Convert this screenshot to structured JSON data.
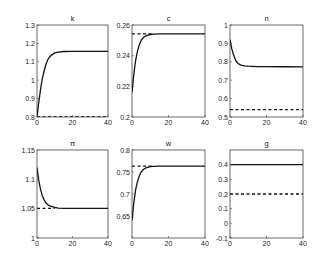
{
  "figure": {
    "rows": 2,
    "cols": 3,
    "line_color": "#111111",
    "axis_color": "#444444"
  },
  "chart_data": [
    {
      "type": "line",
      "title": "k",
      "xlabel": "",
      "ylabel": "",
      "xlim": [
        0,
        40
      ],
      "ylim": [
        0.8,
        1.3
      ],
      "xticks": [
        0,
        20,
        40
      ],
      "yticks": [
        0.8,
        0.9,
        1,
        1.1,
        1.2,
        1.3
      ],
      "ytick_labels": [
        "0.8",
        "0.9",
        "1",
        "1.1",
        "1.2",
        "1.3"
      ],
      "grid": false,
      "series": [
        {
          "name": "transition",
          "style": "solid",
          "x": [
            0,
            1,
            2,
            3,
            4,
            5,
            6,
            7,
            8,
            10,
            12,
            15,
            20,
            25,
            30,
            40
          ],
          "y": [
            0.8,
            0.88,
            0.95,
            1.01,
            1.05,
            1.085,
            1.11,
            1.125,
            1.135,
            1.148,
            1.153,
            1.156,
            1.157,
            1.157,
            1.157,
            1.157
          ]
        },
        {
          "name": "initial",
          "style": "dashed",
          "x": [
            0,
            40
          ],
          "y": [
            0.8,
            0.8
          ]
        }
      ]
    },
    {
      "type": "line",
      "title": "c",
      "xlabel": "",
      "ylabel": "",
      "xlim": [
        0,
        40
      ],
      "ylim": [
        0.2,
        0.26
      ],
      "xticks": [
        0,
        20,
        40
      ],
      "yticks": [
        0.2,
        0.22,
        0.24,
        0.26
      ],
      "ytick_labels": [
        "0.2",
        "0.22",
        "0.24",
        "0.26"
      ],
      "grid": false,
      "series": [
        {
          "name": "transition",
          "style": "solid",
          "x": [
            0,
            1,
            2,
            3,
            4,
            5,
            6,
            7,
            8,
            10,
            12,
            15,
            20,
            30,
            40
          ],
          "y": [
            0.216,
            0.228,
            0.237,
            0.243,
            0.247,
            0.25,
            0.2515,
            0.2525,
            0.253,
            0.2538,
            0.254,
            0.2542,
            0.2542,
            0.2542,
            0.2542
          ]
        },
        {
          "name": "steady",
          "style": "dashed",
          "x": [
            0,
            12
          ],
          "y": [
            0.2542,
            0.2542
          ]
        }
      ]
    },
    {
      "type": "line",
      "title": "n",
      "xlabel": "",
      "ylabel": "",
      "xlim": [
        0,
        40
      ],
      "ylim": [
        0.5,
        1.0
      ],
      "xticks": [
        0,
        20,
        40
      ],
      "yticks": [
        0.5,
        0.6,
        0.7,
        0.8,
        0.9,
        1
      ],
      "ytick_labels": [
        "0.5",
        "0.6",
        "0.7",
        "0.8",
        "0.9",
        "1"
      ],
      "grid": false,
      "series": [
        {
          "name": "transition",
          "style": "solid",
          "x": [
            0,
            1,
            2,
            3,
            4,
            5,
            6,
            8,
            10,
            12,
            15,
            20,
            30,
            40
          ],
          "y": [
            0.92,
            0.87,
            0.835,
            0.81,
            0.795,
            0.787,
            0.782,
            0.778,
            0.776,
            0.775,
            0.774,
            0.774,
            0.773,
            0.772
          ]
        },
        {
          "name": "initial",
          "style": "dashed",
          "x": [
            0,
            40
          ],
          "y": [
            0.54,
            0.54
          ]
        }
      ]
    },
    {
      "type": "line",
      "title": "π",
      "xlabel": "",
      "ylabel": "",
      "xlim": [
        0,
        40
      ],
      "ylim": [
        1.0,
        1.15
      ],
      "xticks": [
        0,
        20,
        40
      ],
      "yticks": [
        1,
        1.05,
        1.1,
        1.15
      ],
      "ytick_labels": [
        "1",
        "1.05",
        "1.1",
        "1.15"
      ],
      "grid": false,
      "series": [
        {
          "name": "transition",
          "style": "solid",
          "x": [
            0,
            1,
            2,
            3,
            4,
            5,
            6,
            7,
            8,
            10,
            12,
            15,
            20,
            30,
            40
          ],
          "y": [
            1.12,
            1.098,
            1.083,
            1.072,
            1.065,
            1.06,
            1.057,
            1.055,
            1.054,
            1.052,
            1.051,
            1.0505,
            1.0505,
            1.0505,
            1.0505
          ]
        },
        {
          "name": "steady",
          "style": "dashed",
          "x": [
            0,
            10
          ],
          "y": [
            1.0505,
            1.0505
          ]
        }
      ]
    },
    {
      "type": "line",
      "title": "w",
      "xlabel": "",
      "ylabel": "",
      "xlim": [
        0,
        40
      ],
      "ylim": [
        0.6,
        0.8
      ],
      "xticks": [
        0,
        20,
        40
      ],
      "yticks": [
        0.65,
        0.7,
        0.75,
        0.8
      ],
      "ytick_labels": [
        "0.65",
        "0.7",
        "0.75",
        "0.8"
      ],
      "grid": false,
      "series": [
        {
          "name": "transition",
          "style": "solid",
          "x": [
            0,
            1,
            2,
            3,
            4,
            5,
            6,
            7,
            8,
            10,
            12,
            15,
            20,
            30,
            40
          ],
          "y": [
            0.64,
            0.68,
            0.71,
            0.728,
            0.741,
            0.75,
            0.755,
            0.758,
            0.76,
            0.762,
            0.763,
            0.7635,
            0.7635,
            0.7635,
            0.7635
          ]
        },
        {
          "name": "steady",
          "style": "dashed",
          "x": [
            0,
            12
          ],
          "y": [
            0.7635,
            0.7635
          ]
        }
      ]
    },
    {
      "type": "line",
      "title": "g",
      "xlabel": "",
      "ylabel": "",
      "xlim": [
        0,
        40
      ],
      "ylim": [
        -0.1,
        0.5
      ],
      "xticks": [
        0,
        20,
        40
      ],
      "yticks": [
        -0.1,
        0,
        0.1,
        0.2,
        0.3,
        0.4
      ],
      "ytick_labels": [
        "-0.1",
        "0",
        "0.1",
        "0.2",
        "0.3",
        "0.4"
      ],
      "grid": false,
      "series": [
        {
          "name": "transition",
          "style": "solid",
          "x": [
            0,
            40
          ],
          "y": [
            0.4,
            0.4
          ]
        },
        {
          "name": "initial",
          "style": "dashed",
          "x": [
            0,
            40
          ],
          "y": [
            0.2,
            0.2
          ]
        }
      ]
    }
  ]
}
